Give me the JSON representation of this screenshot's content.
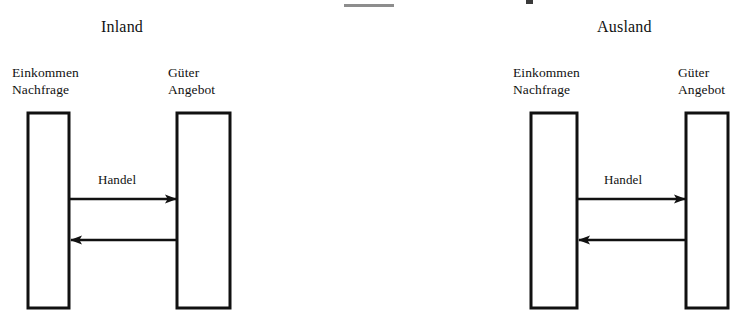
{
  "diagram": {
    "title_fragment_visible": true,
    "groups": [
      {
        "id": "inland",
        "title": "Inland",
        "nodes": [
          {
            "id": "inland-einkommen",
            "line1": "Einkommen",
            "line2": "Nachfrage"
          },
          {
            "id": "inland-gueter",
            "line1": "Güter",
            "line2": "Angebot"
          }
        ],
        "edges": [
          {
            "id": "inland-handel-forward",
            "label": "Handel",
            "direction": "right"
          },
          {
            "id": "inland-handel-back",
            "label": "",
            "direction": "left"
          }
        ]
      },
      {
        "id": "ausland",
        "title": "Ausland",
        "nodes": [
          {
            "id": "ausland-einkommen",
            "line1": "Einkommen",
            "line2": "Nachfrage"
          },
          {
            "id": "ausland-gueter",
            "line1": "Güter",
            "line2": "Angebot"
          }
        ],
        "edges": [
          {
            "id": "ausland-handel-forward",
            "label": "Handel",
            "direction": "right"
          },
          {
            "id": "ausland-handel-back",
            "label": "",
            "direction": "left"
          }
        ]
      }
    ],
    "colors": {
      "ink": "#111111",
      "background": "#ffffff",
      "faint_rule": "#8d8d8d"
    }
  }
}
